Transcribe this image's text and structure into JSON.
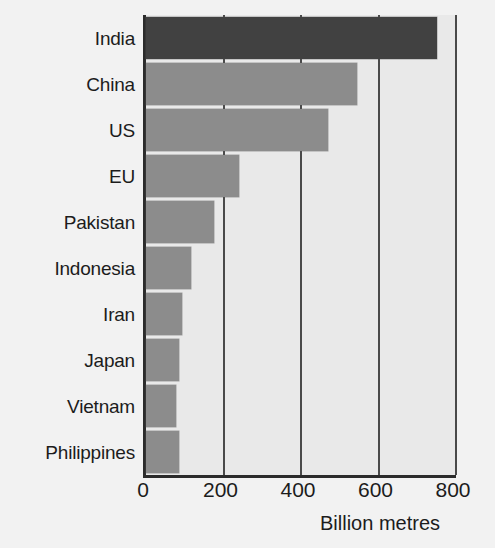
{
  "chart_data": {
    "type": "bar",
    "orientation": "horizontal",
    "title": "",
    "subtitle": "",
    "xlabel": "Billion metres",
    "ylabel": "",
    "categories": [
      "India",
      "China",
      "US",
      "EU",
      "Pakistan",
      "Indonesia",
      "Iran",
      "Japan",
      "Vietnam",
      "Philippines"
    ],
    "values": [
      750,
      545,
      470,
      240,
      175,
      115,
      92,
      85,
      78,
      85
    ],
    "xlim": [
      0,
      800
    ],
    "xticks": [
      0,
      200,
      400,
      600,
      800
    ],
    "xtick_labels": [
      "0",
      "200",
      "400",
      "600",
      "800"
    ],
    "grid": true,
    "grid_axis": "x",
    "legend": false,
    "highlight_category": "India",
    "bar_color": "#8c8c8c",
    "highlight_color": "#414141",
    "plot_background": "#e9e9e9",
    "page_background": "#f2f2f2",
    "axis_color": "#2b2b2b",
    "gridline_color": "#4a4a4a",
    "text_color": "#1c1c1c",
    "bars": [
      {
        "label": "India",
        "value": 750,
        "highlight": true
      },
      {
        "label": "China",
        "value": 545,
        "highlight": false
      },
      {
        "label": "US",
        "value": 470,
        "highlight": false
      },
      {
        "label": "EU",
        "value": 240,
        "highlight": false
      },
      {
        "label": "Pakistan",
        "value": 175,
        "highlight": false
      },
      {
        "label": "Indonesia",
        "value": 115,
        "highlight": false
      },
      {
        "label": "Iran",
        "value": 92,
        "highlight": false
      },
      {
        "label": "Japan",
        "value": 85,
        "highlight": false
      },
      {
        "label": "Vietnam",
        "value": 78,
        "highlight": false
      },
      {
        "label": "Philippines",
        "value": 85,
        "highlight": false
      }
    ]
  }
}
